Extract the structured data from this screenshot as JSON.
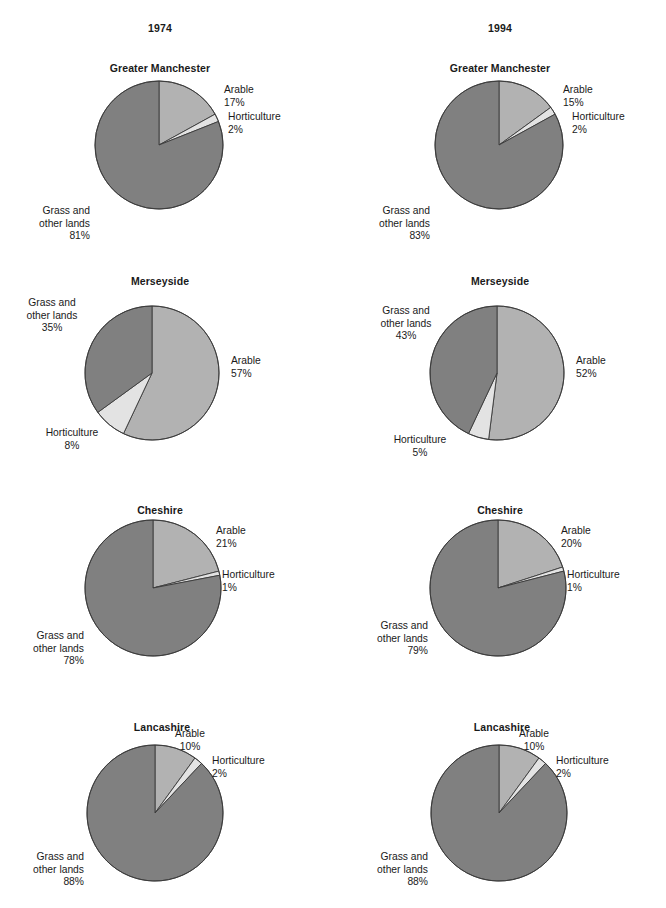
{
  "columns": [
    {
      "id": "col-1974",
      "year_label": "1974",
      "center_x": 160
    },
    {
      "id": "col-1994",
      "year_label": "1994",
      "center_x": 500
    }
  ],
  "legend_names": {
    "arable": "Arable",
    "horticulture": "Horticulture",
    "grass": "Grass and\nother lands"
  },
  "colors": {
    "arable": "#b2b2b2",
    "horticulture": "#e3e3e3",
    "grass": "#808080",
    "outline": "#3a3a3a",
    "text": "#1a1a1a",
    "background": "#ffffff"
  },
  "chart_data": [
    {
      "id": "manchester-1974",
      "type": "pie",
      "title": "Greater Manchester",
      "year": "1974",
      "region": "Greater Manchester",
      "categories": [
        "Arable",
        "Horticulture",
        "Grass and other lands"
      ],
      "values": [
        17,
        2,
        81
      ],
      "labels": [
        "17%",
        "2%",
        "81%"
      ],
      "units": "percent",
      "start_angle_deg": 0,
      "direction": "clockwise"
    },
    {
      "id": "manchester-1994",
      "type": "pie",
      "title": "Greater Manchester",
      "year": "1994",
      "region": "Greater Manchester",
      "categories": [
        "Arable",
        "Horticulture",
        "Grass and other lands"
      ],
      "values": [
        15,
        2,
        83
      ],
      "labels": [
        "15%",
        "2%",
        "83%"
      ],
      "units": "percent",
      "start_angle_deg": 0,
      "direction": "clockwise"
    },
    {
      "id": "merseyside-1974",
      "type": "pie",
      "title": "Merseyside",
      "year": "1974",
      "region": "Merseyside",
      "categories": [
        "Arable",
        "Horticulture",
        "Grass and other lands"
      ],
      "values": [
        57,
        8,
        35
      ],
      "labels": [
        "57%",
        "8%",
        "35%"
      ],
      "units": "percent",
      "start_angle_deg": 0,
      "direction": "clockwise"
    },
    {
      "id": "merseyside-1994",
      "type": "pie",
      "title": "Merseyside",
      "year": "1994",
      "region": "Merseyside",
      "categories": [
        "Arable",
        "Horticulture",
        "Grass and other lands"
      ],
      "values": [
        52,
        5,
        43
      ],
      "labels": [
        "52%",
        "5%",
        "43%"
      ],
      "units": "percent",
      "start_angle_deg": 0,
      "direction": "clockwise"
    },
    {
      "id": "cheshire-1974",
      "type": "pie",
      "title": "Cheshire",
      "year": "1974",
      "region": "Cheshire",
      "categories": [
        "Arable",
        "Horticulture",
        "Grass and other lands"
      ],
      "values": [
        21,
        1,
        78
      ],
      "labels": [
        "21%",
        "1%",
        "78%"
      ],
      "units": "percent",
      "start_angle_deg": 0,
      "direction": "clockwise"
    },
    {
      "id": "cheshire-1994",
      "type": "pie",
      "title": "Cheshire",
      "year": "1994",
      "region": "Cheshire",
      "categories": [
        "Arable",
        "Horticulture",
        "Grass and other lands"
      ],
      "values": [
        20,
        1,
        79
      ],
      "labels": [
        "20%",
        "1%",
        "79%"
      ],
      "units": "percent",
      "start_angle_deg": 0,
      "direction": "clockwise"
    },
    {
      "id": "lancashire-1974",
      "type": "pie",
      "title": "Lancashire",
      "year": "1974",
      "region": "Lancashire",
      "categories": [
        "Arable",
        "Horticulture",
        "Grass and other lands"
      ],
      "values": [
        10,
        2,
        88
      ],
      "labels": [
        "10%",
        "2%",
        "88%"
      ],
      "units": "percent",
      "start_angle_deg": 0,
      "direction": "clockwise"
    },
    {
      "id": "lancashire-1994",
      "type": "pie",
      "title": "Lancashire",
      "year": "1994",
      "region": "Lancashire",
      "categories": [
        "Arable",
        "Horticulture",
        "Grass and other lands"
      ],
      "values": [
        10,
        2,
        88
      ],
      "labels": [
        "10%",
        "2%",
        "88%"
      ],
      "units": "percent",
      "start_angle_deg": 0,
      "direction": "clockwise"
    }
  ],
  "panels": [
    {
      "chart": 0,
      "title_x": 160,
      "title_y": 62,
      "cx": 159,
      "cy": 145,
      "r": 64,
      "labels": [
        {
          "key": "arable",
          "name": "arable",
          "align": "l",
          "x": 224,
          "y": 84,
          "text": "Arable",
          "pct": "17%"
        },
        {
          "key": "horticulture",
          "name": "horticulture",
          "align": "l",
          "x": 228,
          "y": 111,
          "text": "Horticulture",
          "pct": "2%"
        },
        {
          "key": "grass",
          "name": "grass",
          "align": "r",
          "x": 90,
          "y": 205,
          "text": "Grass and\nother lands",
          "pct": "81%"
        }
      ]
    },
    {
      "chart": 1,
      "title_x": 500,
      "title_y": 62,
      "cx": 499,
      "cy": 145,
      "r": 64,
      "labels": [
        {
          "key": "arable",
          "name": "arable",
          "align": "l",
          "x": 563,
          "y": 84,
          "text": "Arable",
          "pct": "15%"
        },
        {
          "key": "horticulture",
          "name": "horticulture",
          "align": "l",
          "x": 572,
          "y": 111,
          "text": "Horticulture",
          "pct": "2%"
        },
        {
          "key": "grass",
          "name": "grass",
          "align": "r",
          "x": 430,
          "y": 205,
          "text": "Grass and\nother lands",
          "pct": "83%"
        }
      ]
    },
    {
      "chart": 2,
      "title_x": 160,
      "title_y": 275,
      "cx": 152,
      "cy": 373,
      "r": 67,
      "labels": [
        {
          "key": "arable",
          "name": "arable",
          "align": "l",
          "x": 231,
          "y": 355,
          "text": "Arable",
          "pct": "57%"
        },
        {
          "key": "horticulture",
          "name": "horticulture",
          "align": "c",
          "x": 72,
          "y": 427,
          "text": "Horticulture",
          "pct": "8%"
        },
        {
          "key": "grass",
          "name": "grass",
          "align": "c",
          "x": 52,
          "y": 297,
          "text": "Grass and\nother lands",
          "pct": "35%"
        }
      ]
    },
    {
      "chart": 3,
      "title_x": 500,
      "title_y": 275,
      "cx": 497,
      "cy": 373,
      "r": 67,
      "labels": [
        {
          "key": "arable",
          "name": "arable",
          "align": "l",
          "x": 576,
          "y": 355,
          "text": "Arable",
          "pct": "52%"
        },
        {
          "key": "horticulture",
          "name": "horticulture",
          "align": "c",
          "x": 420,
          "y": 434,
          "text": "Horticulture",
          "pct": "5%"
        },
        {
          "key": "grass",
          "name": "grass",
          "align": "c",
          "x": 406,
          "y": 305,
          "text": "Grass and\nother lands",
          "pct": "43%"
        }
      ]
    },
    {
      "chart": 4,
      "title_x": 160,
      "title_y": 504,
      "cx": 153,
      "cy": 588,
      "r": 68,
      "labels": [
        {
          "key": "arable",
          "name": "arable",
          "align": "l",
          "x": 216,
          "y": 525,
          "text": "Arable",
          "pct": "21%"
        },
        {
          "key": "horticulture",
          "name": "horticulture",
          "align": "l",
          "x": 222,
          "y": 569,
          "text": "Horticulture",
          "pct": "1%"
        },
        {
          "key": "grass",
          "name": "grass",
          "align": "r",
          "x": 84,
          "y": 630,
          "text": "Grass and\nother lands",
          "pct": "78%"
        }
      ]
    },
    {
      "chart": 5,
      "title_x": 500,
      "title_y": 504,
      "cx": 498,
      "cy": 588,
      "r": 68,
      "labels": [
        {
          "key": "arable",
          "name": "arable",
          "align": "l",
          "x": 561,
          "y": 525,
          "text": "Arable",
          "pct": "20%"
        },
        {
          "key": "horticulture",
          "name": "horticulture",
          "align": "l",
          "x": 567,
          "y": 569,
          "text": "Horticulture",
          "pct": "1%"
        },
        {
          "key": "grass",
          "name": "grass",
          "align": "r",
          "x": 428,
          "y": 620,
          "text": "Grass and\nother lands",
          "pct": "79%"
        }
      ]
    },
    {
      "chart": 6,
      "title_x": 162,
      "title_y": 721,
      "cx": 155,
      "cy": 813,
      "r": 68,
      "labels": [
        {
          "key": "arable",
          "name": "arable",
          "align": "c",
          "x": 190,
          "y": 728,
          "text": "Arable",
          "pct": "10%"
        },
        {
          "key": "horticulture",
          "name": "horticulture",
          "align": "l",
          "x": 212,
          "y": 755,
          "text": "Horticulture",
          "pct": "2%"
        },
        {
          "key": "grass",
          "name": "grass",
          "align": "r",
          "x": 84,
          "y": 851,
          "text": "Grass and\nother lands",
          "pct": "88%"
        }
      ]
    },
    {
      "chart": 7,
      "title_x": 502,
      "title_y": 721,
      "cx": 499,
      "cy": 813,
      "r": 68,
      "labels": [
        {
          "key": "arable",
          "name": "arable",
          "align": "c",
          "x": 534,
          "y": 728,
          "text": "Arable",
          "pct": "10%"
        },
        {
          "key": "horticulture",
          "name": "horticulture",
          "align": "l",
          "x": 556,
          "y": 755,
          "text": "Horticulture",
          "pct": "2%"
        },
        {
          "key": "grass",
          "name": "grass",
          "align": "r",
          "x": 428,
          "y": 851,
          "text": "Grass and\nother lands",
          "pct": "88%"
        }
      ]
    }
  ]
}
